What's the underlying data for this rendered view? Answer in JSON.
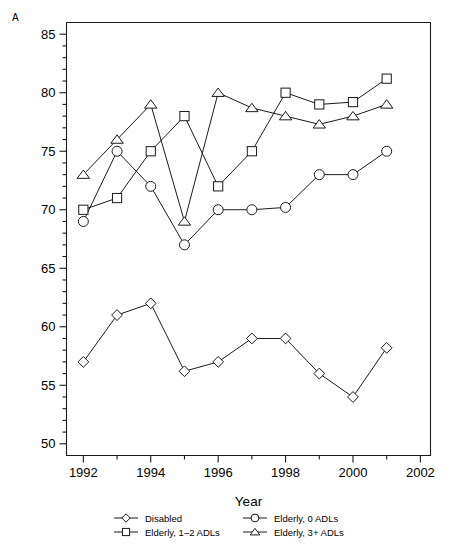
{
  "panel": {
    "label": "A"
  },
  "axes": {
    "xlabel": "Year",
    "ylabel": "",
    "x_ticks": [
      1992,
      1994,
      1996,
      1998,
      2000,
      2002
    ],
    "y_ticks": [
      50,
      55,
      60,
      65,
      70,
      75,
      80,
      85
    ],
    "xlim": [
      1991.5,
      2002.3
    ],
    "ylim": [
      49.0,
      86.0
    ],
    "x_minor_step": 1,
    "y_minor_step": 1,
    "grid": false
  },
  "legend": {
    "position": "below-axis",
    "entries": [
      {
        "label": "Disabled",
        "marker": "diamond"
      },
      {
        "label": "Elderly, 0 ADLs",
        "marker": "circle"
      },
      {
        "label": "Elderly, 1–2 ADLs",
        "marker": "square"
      },
      {
        "label": "Elderly, 3+ ADLs",
        "marker": "triangle"
      }
    ]
  },
  "chart_data": {
    "type": "line",
    "title": "",
    "xlabel": "Year",
    "ylabel": "",
    "xlim": [
      1991.5,
      2002.3
    ],
    "ylim": [
      49.0,
      86.0
    ],
    "grid": false,
    "legend_position": "below-axis",
    "x": [
      1992,
      1993,
      1994,
      1995,
      1996,
      1997,
      1998,
      1999,
      2000,
      2001
    ],
    "series": [
      {
        "name": "Disabled",
        "marker": "diamond",
        "values": [
          57.0,
          61.0,
          62.0,
          56.2,
          57.0,
          59.0,
          59.0,
          56.0,
          54.0,
          58.2
        ]
      },
      {
        "name": "Elderly, 0 ADLs",
        "marker": "circle",
        "values": [
          69.0,
          75.0,
          72.0,
          67.0,
          70.0,
          70.0,
          70.2,
          73.0,
          73.0,
          75.0
        ]
      },
      {
        "name": "Elderly, 1–2 ADLs",
        "marker": "square",
        "values": [
          70.0,
          71.0,
          75.0,
          78.0,
          72.0,
          75.0,
          80.0,
          79.0,
          79.2,
          81.2
        ]
      },
      {
        "name": "Elderly, 3+ ADLs",
        "marker": "triangle",
        "values": [
          73.0,
          76.0,
          79.0,
          69.0,
          80.0,
          78.7,
          78.0,
          77.3,
          78.0,
          79.0
        ]
      }
    ]
  }
}
